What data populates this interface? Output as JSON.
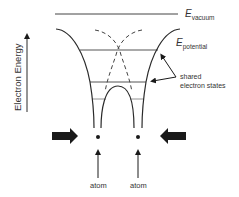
{
  "diagram": {
    "type": "energy-level-diagram",
    "axis": {
      "label": "Electron Energy",
      "direction": "up"
    },
    "levels": {
      "vacuum": {
        "symbol": "E",
        "subscript": "vacuum"
      },
      "potential": {
        "symbol": "E",
        "subscript": "potential"
      }
    },
    "annotations": {
      "shared_states_line1": "shared",
      "shared_states_line2": "electron states"
    },
    "atoms": [
      {
        "label": "atom"
      },
      {
        "label": "atom"
      }
    ],
    "colors": {
      "line": "#2a2a2a",
      "level": "#555555",
      "arrow": "#1a1a1a"
    }
  }
}
